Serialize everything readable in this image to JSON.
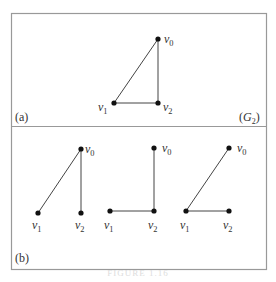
{
  "figure": {
    "frame": {
      "x": 11,
      "y": 13,
      "w": 255,
      "h": 256,
      "divider_y": 126,
      "stroke": "#999999"
    },
    "caption": "FIGURE 1.16",
    "panels": [
      {
        "id": "a",
        "label": "(a)",
        "label_pos": [
          15,
          121
        ],
        "graph_name_base": "G",
        "graph_name_sub": "2",
        "graph_name_pos": [
          239,
          121
        ],
        "graphs": [
          {
            "vertices": [
              {
                "name": "v",
                "sub": "0",
                "x": 158,
                "y": 39,
                "lx": 164,
                "ly": 43
              },
              {
                "name": "v",
                "sub": "1",
                "x": 114,
                "y": 103,
                "lx": 98,
                "ly": 111
              },
              {
                "name": "v",
                "sub": "2",
                "x": 158,
                "y": 103,
                "lx": 163,
                "ly": 111
              }
            ],
            "edges": [
              [
                0,
                1
              ],
              [
                0,
                2
              ],
              [
                1,
                2
              ]
            ]
          }
        ]
      },
      {
        "id": "b",
        "label": "(b)",
        "label_pos": [
          15,
          262
        ],
        "graphs": [
          {
            "vertices": [
              {
                "name": "v",
                "sub": "0",
                "x": 81,
                "y": 149,
                "lx": 85,
                "ly": 153
              },
              {
                "name": "v",
                "sub": "1",
                "x": 38,
                "y": 213,
                "lx": 32,
                "ly": 229
              },
              {
                "name": "v",
                "sub": "2",
                "x": 81,
                "y": 213,
                "lx": 75,
                "ly": 229
              }
            ],
            "edges": [
              [
                0,
                1
              ],
              [
                0,
                2
              ]
            ]
          },
          {
            "vertices": [
              {
                "name": "v",
                "sub": "0",
                "x": 154,
                "y": 148,
                "lx": 162,
                "ly": 152
              },
              {
                "name": "v",
                "sub": "1",
                "x": 110,
                "y": 211,
                "lx": 104,
                "ly": 229
              },
              {
                "name": "v",
                "sub": "2",
                "x": 154,
                "y": 211,
                "lx": 148,
                "ly": 229
              }
            ],
            "edges": [
              [
                0,
                2
              ],
              [
                1,
                2
              ]
            ]
          },
          {
            "vertices": [
              {
                "name": "v",
                "sub": "0",
                "x": 229,
                "y": 148,
                "lx": 237,
                "ly": 152
              },
              {
                "name": "v",
                "sub": "1",
                "x": 186,
                "y": 211,
                "lx": 180,
                "ly": 229
              },
              {
                "name": "v",
                "sub": "2",
                "x": 229,
                "y": 211,
                "lx": 223,
                "ly": 229
              }
            ],
            "edges": [
              [
                0,
                1
              ],
              [
                1,
                2
              ]
            ]
          }
        ]
      }
    ]
  }
}
